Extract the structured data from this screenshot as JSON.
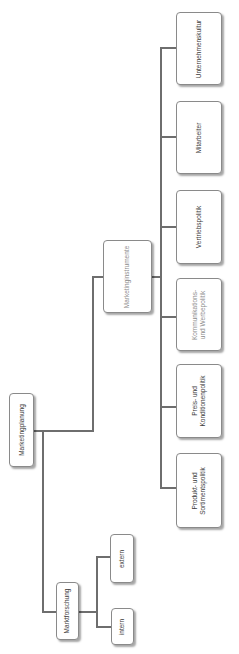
{
  "diagram": {
    "type": "org-tree",
    "orientation": "rotated-90-ccw",
    "colors": {
      "line": "#6e6e6e",
      "border": "#8a8a8a",
      "text": "#3a3a3a",
      "text_light": "#8c8c8c"
    },
    "root": {
      "label": "Marketingplanung"
    },
    "branches": {
      "marktforschung": {
        "label": "Marktforschung",
        "children": [
          {
            "label": "intern"
          },
          {
            "label": "extern"
          }
        ]
      },
      "marketinginstrumente": {
        "label": "Marketinginstrumente",
        "children": [
          {
            "label": "Produkt- und\nSortimentspolitik"
          },
          {
            "label": "Preis- und\nKonditionenpolitik"
          },
          {
            "label": "Kommunikations-\nund Werbepolitik"
          },
          {
            "label": "Vertriebspolitik"
          },
          {
            "label": "Mitarbeiter"
          },
          {
            "label": "Unternehmenskultur"
          }
        ]
      }
    }
  }
}
